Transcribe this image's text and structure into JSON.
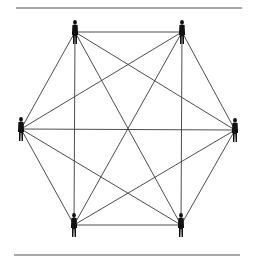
{
  "diagram": {
    "type": "complete-graph",
    "colors": {
      "lines": "#3a3a3a",
      "figures": "#111111",
      "rules": "#555555",
      "background": "#ffffff"
    },
    "rules": [
      {
        "id": "top-rule",
        "x1": 16,
        "y1": 8,
        "x2": 242,
        "y2": 8
      },
      {
        "id": "bottom-rule",
        "x1": 14,
        "y1": 255,
        "x2": 240,
        "y2": 255
      }
    ],
    "nodes": [
      {
        "id": "top-left",
        "icon": "person-icon",
        "x": 75,
        "y": 32
      },
      {
        "id": "top-right",
        "icon": "person-icon",
        "x": 182,
        "y": 32
      },
      {
        "id": "left",
        "icon": "person-icon",
        "x": 21,
        "y": 129
      },
      {
        "id": "right",
        "icon": "person-icon",
        "x": 235,
        "y": 130
      },
      {
        "id": "bottom-left",
        "icon": "person-icon",
        "x": 74,
        "y": 225
      },
      {
        "id": "bottom-right",
        "icon": "person-icon",
        "x": 181,
        "y": 225
      }
    ],
    "edges": [
      [
        "top-left",
        "top-right"
      ],
      [
        "top-left",
        "left"
      ],
      [
        "top-left",
        "right"
      ],
      [
        "top-left",
        "bottom-left"
      ],
      [
        "top-left",
        "bottom-right"
      ],
      [
        "top-right",
        "left"
      ],
      [
        "top-right",
        "right"
      ],
      [
        "top-right",
        "bottom-left"
      ],
      [
        "top-right",
        "bottom-right"
      ],
      [
        "left",
        "right"
      ],
      [
        "left",
        "bottom-left"
      ],
      [
        "left",
        "bottom-right"
      ],
      [
        "right",
        "bottom-left"
      ],
      [
        "right",
        "bottom-right"
      ],
      [
        "bottom-left",
        "bottom-right"
      ]
    ]
  }
}
